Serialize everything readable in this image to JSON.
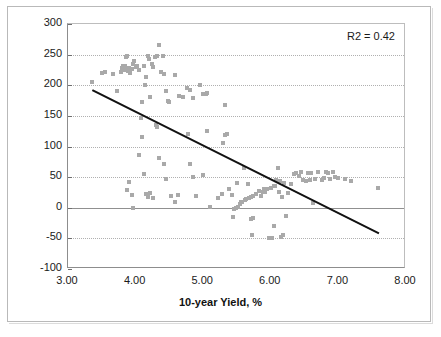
{
  "chart_data": {
    "type": "scatter",
    "title": "",
    "xlabel": "10-year Yield, %",
    "ylabel": "2s / 10s Slope, Basis Points",
    "xlim": [
      3.0,
      8.0
    ],
    "ylim": [
      -100,
      300
    ],
    "xticks": [
      "3.00",
      "4.00",
      "5.00",
      "6.00",
      "7.00",
      "8.00"
    ],
    "xtick_values": [
      3.0,
      4.0,
      5.0,
      6.0,
      7.0,
      8.0
    ],
    "yticks": [
      "300",
      "250",
      "200",
      "150",
      "100",
      "50",
      "0",
      "-50",
      "-100"
    ],
    "ytick_values": [
      300,
      250,
      200,
      150,
      100,
      50,
      0,
      -50,
      -100
    ],
    "grid": "horizontal-dotted",
    "legend": "none",
    "annotations": [
      {
        "name": "r2",
        "text": "R2 = 0.42",
        "position": "top-right"
      }
    ],
    "marker": {
      "shape": "square",
      "size": 4,
      "color": "#a9a9a9"
    },
    "trendline": {
      "type": "linear",
      "color": "#111111",
      "width": 2,
      "x_start": 3.36,
      "y_start": 192,
      "x_end": 7.6,
      "y_end": -42
    },
    "series": [
      {
        "name": "2s/10s Slope vs 10-year Yield",
        "points": [
          [
            3.36,
            205
          ],
          [
            3.5,
            220
          ],
          [
            3.55,
            221
          ],
          [
            3.66,
            218
          ],
          [
            3.72,
            191
          ],
          [
            3.78,
            222
          ],
          [
            3.8,
            228
          ],
          [
            3.82,
            232
          ],
          [
            3.84,
            225
          ],
          [
            3.85,
            231
          ],
          [
            3.86,
            246
          ],
          [
            3.88,
            248
          ],
          [
            3.89,
            223
          ],
          [
            3.9,
            228
          ],
          [
            3.92,
            220
          ],
          [
            3.94,
            226
          ],
          [
            3.96,
            235
          ],
          [
            3.98,
            240
          ],
          [
            4.0,
            229
          ],
          [
            4.02,
            232
          ],
          [
            4.05,
            225
          ],
          [
            4.08,
            147
          ],
          [
            4.1,
            172
          ],
          [
            4.12,
            231
          ],
          [
            4.14,
            200
          ],
          [
            4.16,
            213
          ],
          [
            4.18,
            248
          ],
          [
            4.2,
            243
          ],
          [
            4.22,
            181
          ],
          [
            4.24,
            235
          ],
          [
            4.26,
            229
          ],
          [
            4.28,
            246
          ],
          [
            4.32,
            248
          ],
          [
            4.35,
            265
          ],
          [
            4.38,
            222
          ],
          [
            4.4,
            248
          ],
          [
            4.42,
            219
          ],
          [
            4.45,
            191
          ],
          [
            4.48,
            174
          ],
          [
            4.5,
            173
          ],
          [
            4.58,
            216
          ],
          [
            4.64,
            183
          ],
          [
            4.7,
            181
          ],
          [
            4.76,
            196
          ],
          [
            4.8,
            192
          ],
          [
            4.85,
            180
          ],
          [
            4.95,
            201
          ],
          [
            5.0,
            186
          ],
          [
            5.04,
            185
          ],
          [
            5.05,
            188
          ],
          [
            5.32,
            167
          ],
          [
            3.88,
            29
          ],
          [
            3.9,
            42
          ],
          [
            3.94,
            21
          ],
          [
            3.96,
            0
          ],
          [
            4.05,
            86
          ],
          [
            4.1,
            115
          ],
          [
            4.12,
            55
          ],
          [
            4.15,
            23
          ],
          [
            4.18,
            17
          ],
          [
            4.22,
            24
          ],
          [
            4.25,
            16
          ],
          [
            4.3,
            135
          ],
          [
            4.32,
            132
          ],
          [
            4.35,
            82
          ],
          [
            4.42,
            71
          ],
          [
            4.45,
            47
          ],
          [
            4.52,
            20
          ],
          [
            4.58,
            10
          ],
          [
            4.62,
            21
          ],
          [
            4.78,
            120
          ],
          [
            4.8,
            72
          ],
          [
            4.85,
            50
          ],
          [
            4.9,
            19
          ],
          [
            5.0,
            53
          ],
          [
            5.05,
            125
          ],
          [
            5.1,
            1
          ],
          [
            5.22,
            16
          ],
          [
            5.28,
            22
          ],
          [
            5.3,
            105
          ],
          [
            5.32,
            118
          ],
          [
            5.35,
            120
          ],
          [
            5.38,
            30
          ],
          [
            5.42,
            21
          ],
          [
            5.44,
            -15
          ],
          [
            5.46,
            -2
          ],
          [
            5.48,
            0
          ],
          [
            5.5,
            41
          ],
          [
            5.52,
            2
          ],
          [
            5.54,
            6
          ],
          [
            5.56,
            9
          ],
          [
            5.58,
            10
          ],
          [
            5.6,
            65
          ],
          [
            5.62,
            12
          ],
          [
            5.64,
            14
          ],
          [
            5.66,
            39
          ],
          [
            5.68,
            16
          ],
          [
            5.7,
            18
          ],
          [
            5.71,
            -18
          ],
          [
            5.72,
            -45
          ],
          [
            5.73,
            -17
          ],
          [
            5.74,
            20
          ],
          [
            5.78,
            22
          ],
          [
            5.82,
            28
          ],
          [
            5.85,
            19
          ],
          [
            5.88,
            26
          ],
          [
            5.9,
            30
          ],
          [
            5.92,
            25
          ],
          [
            5.95,
            31
          ],
          [
            5.98,
            -50
          ],
          [
            6.0,
            33
          ],
          [
            6.02,
            -50
          ],
          [
            6.04,
            35
          ],
          [
            6.05,
            -30
          ],
          [
            6.06,
            36
          ],
          [
            6.08,
            45
          ],
          [
            6.1,
            65
          ],
          [
            6.12,
            26
          ],
          [
            6.14,
            43
          ],
          [
            6.15,
            -48
          ],
          [
            6.16,
            17
          ],
          [
            6.18,
            -44
          ],
          [
            6.2,
            40
          ],
          [
            6.22,
            -13
          ],
          [
            6.25,
            24
          ],
          [
            6.3,
            38
          ],
          [
            6.35,
            55
          ],
          [
            6.38,
            57
          ],
          [
            6.42,
            52
          ],
          [
            6.45,
            59
          ],
          [
            6.48,
            45
          ],
          [
            6.52,
            44
          ],
          [
            6.55,
            56
          ],
          [
            6.58,
            46
          ],
          [
            6.6,
            57
          ],
          [
            6.62,
            8
          ],
          [
            6.65,
            47
          ],
          [
            6.7,
            59
          ],
          [
            6.75,
            45
          ],
          [
            6.78,
            48
          ],
          [
            6.82,
            58
          ],
          [
            6.85,
            56
          ],
          [
            6.88,
            47
          ],
          [
            6.92,
            59
          ],
          [
            6.95,
            50
          ],
          [
            7.0,
            48
          ],
          [
            7.1,
            47
          ],
          [
            7.18,
            44
          ],
          [
            7.58,
            32
          ]
        ]
      }
    ]
  }
}
